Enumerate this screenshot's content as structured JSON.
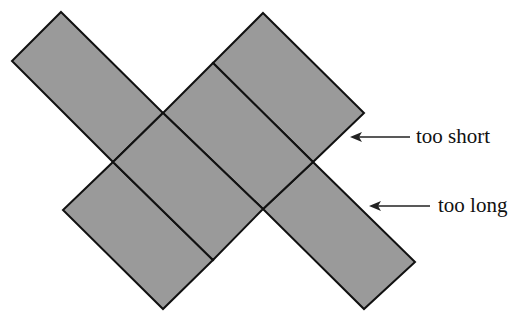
{
  "diagram": {
    "title": "",
    "colors": {
      "tile_fill": "#9a9a9a",
      "tile_stroke": "#111111",
      "arrow": "#222222",
      "text": "#111111"
    },
    "annotations": [
      {
        "id": "too-short",
        "label": "too short"
      },
      {
        "id": "too-long",
        "label": "too long"
      }
    ]
  }
}
